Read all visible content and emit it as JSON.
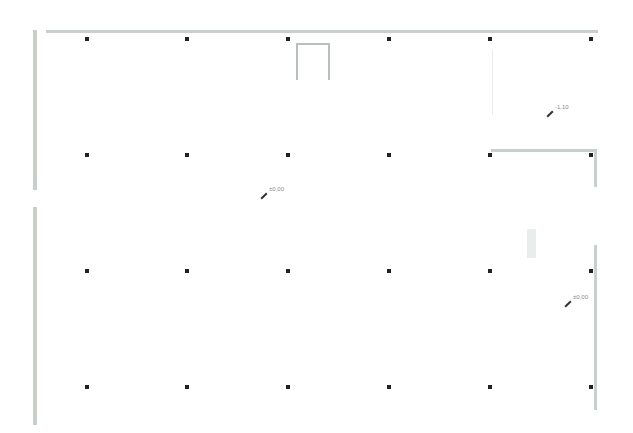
{
  "drawing": {
    "type": "floor-plan",
    "wall_color": "#c9d0cc",
    "column_color": "#222222",
    "grid": {
      "columns_x": [
        87,
        187,
        288,
        389,
        490,
        591
      ],
      "rows_y": [
        39,
        155,
        271,
        387
      ]
    },
    "elevations": [
      {
        "label": "±0,00",
        "x": 260,
        "y": 190
      },
      {
        "label": "-1,10",
        "x": 546,
        "y": 108
      },
      {
        "label": "±0,00",
        "x": 565,
        "y": 298
      }
    ]
  }
}
